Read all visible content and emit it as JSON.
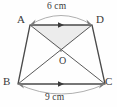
{
  "figure": {
    "shape_type": "trapezium",
    "vertices": [
      {
        "name": "A",
        "label": "A",
        "x": 30,
        "y": 25
      },
      {
        "name": "D",
        "label": "D",
        "x": 92,
        "y": 25
      },
      {
        "name": "B",
        "label": "B",
        "x": 18,
        "y": 84
      },
      {
        "name": "C",
        "label": "C",
        "x": 105,
        "y": 84
      }
    ],
    "intersection_point": {
      "name": "O",
      "label": "O",
      "x": 61,
      "y": 51
    },
    "dimensions": [
      {
        "name": "top-side",
        "edge": "AD",
        "label": "6 cm",
        "value": 6,
        "unit": "cm"
      },
      {
        "name": "bottom-side",
        "edge": "BC",
        "label": "9 cm",
        "value": 9,
        "unit": "cm"
      }
    ],
    "shaded_region": {
      "name": "triangle-AOD",
      "vertices": [
        "A",
        "O",
        "D"
      ],
      "fill": "#ececec"
    },
    "colors": {
      "stroke": "#4a4a4a",
      "thin_stroke": "#8a8a8a",
      "text": "#3a3a3a",
      "shade": "#ececec",
      "background": "#fefefe"
    },
    "parallel_marks": [
      {
        "name": "mark-AD",
        "on_edge": "AD"
      },
      {
        "name": "mark-BC",
        "on_edge": "BC"
      }
    ]
  }
}
